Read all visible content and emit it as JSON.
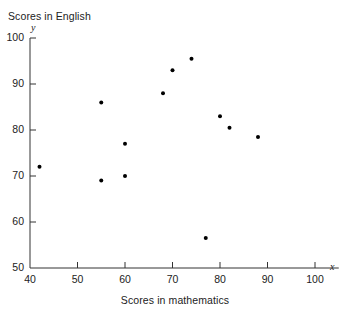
{
  "chart_data": {
    "type": "scatter",
    "title": "",
    "xlabel": "Scores in mathematics",
    "ylabel": "Scores in English",
    "x_axis_symbol": "x",
    "y_axis_symbol": "y",
    "xlim": [
      40,
      105
    ],
    "ylim": [
      50,
      100
    ],
    "xticks": [
      40,
      50,
      60,
      70,
      80,
      90,
      100
    ],
    "yticks": [
      50,
      60,
      70,
      80,
      90,
      100
    ],
    "xtick_labels": [
      "40",
      "50",
      "60",
      "70",
      "80",
      "90",
      "100"
    ],
    "ytick_labels": [
      "50",
      "60",
      "70",
      "80",
      "90",
      "100"
    ],
    "grid": false,
    "legend": null,
    "marker_color": "#000000",
    "axis_color": "#333333",
    "points": [
      {
        "x": 42,
        "y": 72
      },
      {
        "x": 55,
        "y": 86
      },
      {
        "x": 55,
        "y": 69
      },
      {
        "x": 60,
        "y": 77
      },
      {
        "x": 60,
        "y": 70
      },
      {
        "x": 68,
        "y": 88
      },
      {
        "x": 70,
        "y": 93
      },
      {
        "x": 74,
        "y": 95.5
      },
      {
        "x": 77,
        "y": 56.5
      },
      {
        "x": 80,
        "y": 83
      },
      {
        "x": 82,
        "y": 80.5
      },
      {
        "x": 88,
        "y": 78.5
      }
    ]
  }
}
